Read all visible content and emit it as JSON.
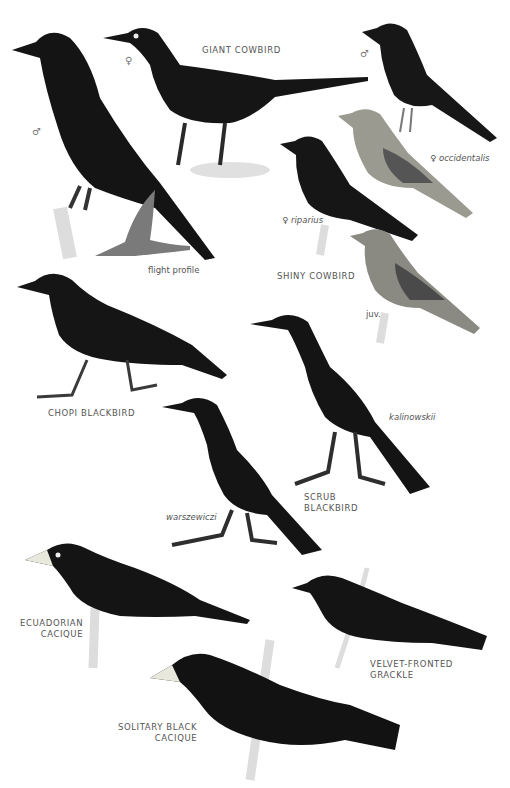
{
  "plate": {
    "species": [
      {
        "name": "GIANT COWBIRD",
        "figures": [
          {
            "sex": "♂"
          },
          {
            "sex": "♀"
          },
          {
            "note": "flight profile"
          }
        ]
      },
      {
        "name": "SHINY COWBIRD",
        "figures": [
          {
            "sex": "♂"
          },
          {
            "sex": "♀",
            "subspecies": "occidentalis"
          },
          {
            "sex": "♀",
            "subspecies": "riparius"
          },
          {
            "note": "juv."
          }
        ]
      },
      {
        "name": "CHOPI BLACKBIRD"
      },
      {
        "name_line1": "SCRUB",
        "name_line2": "BLACKBIRD",
        "figures": [
          {
            "subspecies": "kalinowskii"
          },
          {
            "subspecies": "warszewiczi"
          }
        ]
      },
      {
        "name_line1": "ECUADORIAN",
        "name_line2": "CACIQUE"
      },
      {
        "name_line1": "VELVET-FRONTED",
        "name_line2": "GRACKLE"
      },
      {
        "name_line1": "SOLITARY BLACK",
        "name_line2": "CACIQUE"
      }
    ]
  },
  "labels": {
    "giant_cowbird": "GIANT COWBIRD",
    "male": "♂",
    "female": "♀",
    "flight_profile": "flight profile",
    "shiny_cowbird": "SHINY COWBIRD",
    "occidentalis": "occidentalis",
    "riparius": "riparius",
    "juv": "juv.",
    "chopi": "CHOPI BLACKBIRD",
    "scrub_1": "SCRUB",
    "scrub_2": "BLACKBIRD",
    "kalinowskii": "kalinowskii",
    "warszewiczi": "warszewiczi",
    "ecuadorian_1": "ECUADORIAN",
    "ecuadorian_2": "CACIQUE",
    "velvet_1": "VELVET-FRONTED",
    "velvet_2": "GRACKLE",
    "solitary_1": "SOLITARY BLACK",
    "solitary_2": "CACIQUE"
  },
  "colors": {
    "bird": "#161616",
    "female_shiny": "#9a9a90",
    "perch": "#d8d8d2"
  }
}
